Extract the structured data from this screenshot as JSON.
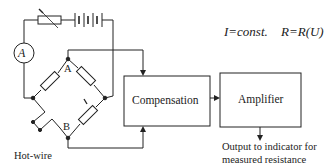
{
  "diagram": {
    "type": "hot-wire anemometer constant current bridge circuit",
    "equations": {
      "current": "I=const.",
      "resistance": "R=R(U)"
    },
    "components": {
      "ammeter_label": "A",
      "node_top_label": "A",
      "node_bottom_label": "B",
      "current_marker": "i",
      "hotwire_label": "Hot-wire"
    },
    "blocks": [
      {
        "id": "compensation",
        "label": "Compensation"
      },
      {
        "id": "amplifier",
        "label": "Amplifier"
      }
    ],
    "output": {
      "line1": "Output to indicator for",
      "line2": "measured resistance"
    },
    "colors": {
      "line": "#222222",
      "background": "#ffffff"
    }
  }
}
